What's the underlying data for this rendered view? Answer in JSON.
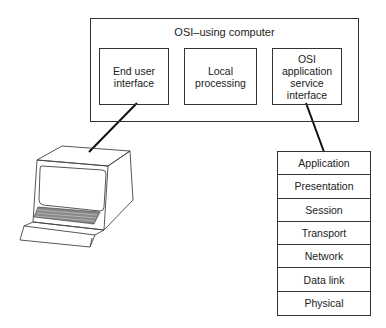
{
  "computer": {
    "title": "OSI–using computer",
    "modules": [
      {
        "label": "End user\ninterface"
      },
      {
        "label": "Local\nprocessing"
      },
      {
        "label": "OSI\napplication\nservice\ninterface"
      }
    ]
  },
  "terminal": {
    "icon": "computer-terminal-icon"
  },
  "osi_stack": {
    "layers": [
      "Application",
      "Presentation",
      "Session",
      "Transport",
      "Network",
      "Data link",
      "Physical"
    ]
  }
}
